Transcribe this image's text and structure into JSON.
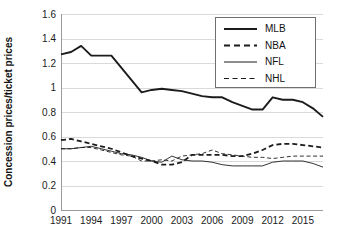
{
  "chart_data": {
    "type": "line",
    "title": "",
    "xlabel": "",
    "ylabel": "Concession prices/ticket prices",
    "xlim": [
      1991,
      2017
    ],
    "ylim": [
      0,
      1.6
    ],
    "grid": true,
    "legend_position": "top-right",
    "x": [
      1991,
      1992,
      1993,
      1994,
      1995,
      1996,
      1997,
      1998,
      1999,
      2000,
      2001,
      2002,
      2003,
      2004,
      2005,
      2006,
      2007,
      2008,
      2009,
      2010,
      2011,
      2012,
      2013,
      2014,
      2015,
      2016,
      2017
    ],
    "xticks": [
      1991,
      1994,
      1997,
      2000,
      2003,
      2006,
      2009,
      2012,
      2015
    ],
    "xticklabels": [
      "1991",
      "1994",
      "1997",
      "2000",
      "2003",
      "2006",
      "2009",
      "2012",
      "2015"
    ],
    "yticks": [
      0,
      0.2,
      0.4,
      0.6,
      0.8,
      1,
      1.2,
      1.4,
      1.6
    ],
    "yticklabels": [
      "0",
      "0.2",
      "0.4",
      "0.6",
      "0.8",
      "1",
      "1.2",
      "1.4",
      "1.6"
    ],
    "series": [
      {
        "name": "MLB",
        "style": "solid",
        "width": 1.9,
        "color": "#1c1c1c",
        "values": [
          1.27,
          1.29,
          1.34,
          1.26,
          1.26,
          1.26,
          1.16,
          1.06,
          0.96,
          0.98,
          0.99,
          0.98,
          0.97,
          0.95,
          0.93,
          0.92,
          0.92,
          0.88,
          0.85,
          0.82,
          0.82,
          0.92,
          0.9,
          0.9,
          0.88,
          0.83,
          0.76
        ]
      },
      {
        "name": "NBA",
        "style": "dashed",
        "width": 1.8,
        "color": "#1c1c1c",
        "values": [
          0.57,
          0.58,
          0.56,
          0.54,
          0.52,
          0.5,
          0.47,
          0.44,
          0.42,
          0.4,
          0.37,
          0.37,
          0.39,
          0.45,
          0.45,
          0.45,
          0.45,
          0.44,
          0.44,
          0.46,
          0.49,
          0.53,
          0.54,
          0.54,
          0.53,
          0.52,
          0.51
        ]
      },
      {
        "name": "NFL",
        "style": "solid",
        "width": 0.9,
        "color": "#4a4a4a",
        "values": [
          0.5,
          0.5,
          0.51,
          0.52,
          0.5,
          0.48,
          0.46,
          0.45,
          0.43,
          0.4,
          0.39,
          0.44,
          0.41,
          0.4,
          0.4,
          0.39,
          0.37,
          0.36,
          0.36,
          0.36,
          0.36,
          0.39,
          0.4,
          0.4,
          0.4,
          0.38,
          0.35
        ]
      },
      {
        "name": "NHL",
        "style": "dashed",
        "width": 0.9,
        "color": "#7a7a7a",
        "values": [
          0.5,
          0.5,
          0.51,
          0.51,
          0.49,
          0.47,
          0.45,
          0.44,
          0.4,
          0.4,
          0.41,
          0.4,
          0.44,
          0.45,
          0.46,
          0.49,
          0.46,
          0.45,
          0.44,
          0.43,
          0.43,
          0.42,
          0.43,
          0.44,
          0.44,
          0.44,
          0.44
        ]
      }
    ],
    "legend": [
      "MLB",
      "NBA",
      "NFL",
      "NHL"
    ]
  }
}
